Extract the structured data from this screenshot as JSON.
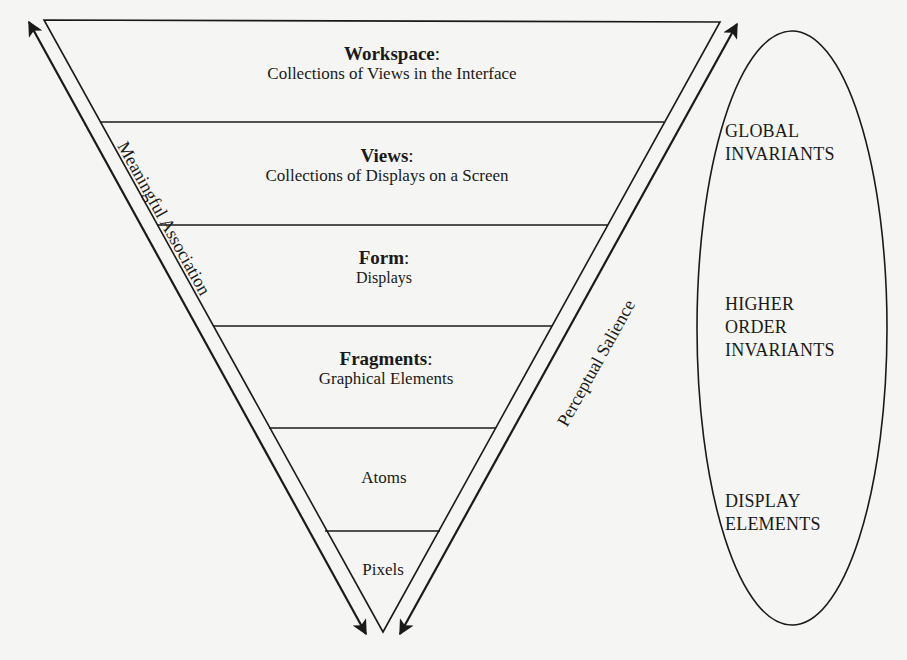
{
  "diagram": {
    "type": "inverted-triangle-hierarchy",
    "levels": [
      {
        "title": "Workspace",
        "separator": ":",
        "description": "Collections of Views in the Interface"
      },
      {
        "title": "Views",
        "separator": ":",
        "description": "Collections of Displays on a Screen"
      },
      {
        "title": "Form",
        "separator": ":",
        "description": "Displays"
      },
      {
        "title": "Fragments",
        "separator": ":",
        "description": "Graphical Elements"
      },
      {
        "label": "Atoms"
      },
      {
        "label": "Pixels"
      }
    ],
    "axes": {
      "left": {
        "label": "Meaningful Association",
        "direction": "bidirectional"
      },
      "right": {
        "label": "Perceptual Salience",
        "direction": "bidirectional"
      }
    },
    "ellipse": {
      "groups": [
        {
          "lines": [
            "GLOBAL",
            "INVARIANTS"
          ]
        },
        {
          "lines": [
            "HIGHER",
            "ORDER",
            "INVARIANTS"
          ]
        },
        {
          "lines": [
            "DISPLAY",
            "ELEMENTS"
          ]
        }
      ]
    },
    "colors": {
      "ink": "#1a1a1a",
      "paper": "#f5f5f3"
    }
  }
}
